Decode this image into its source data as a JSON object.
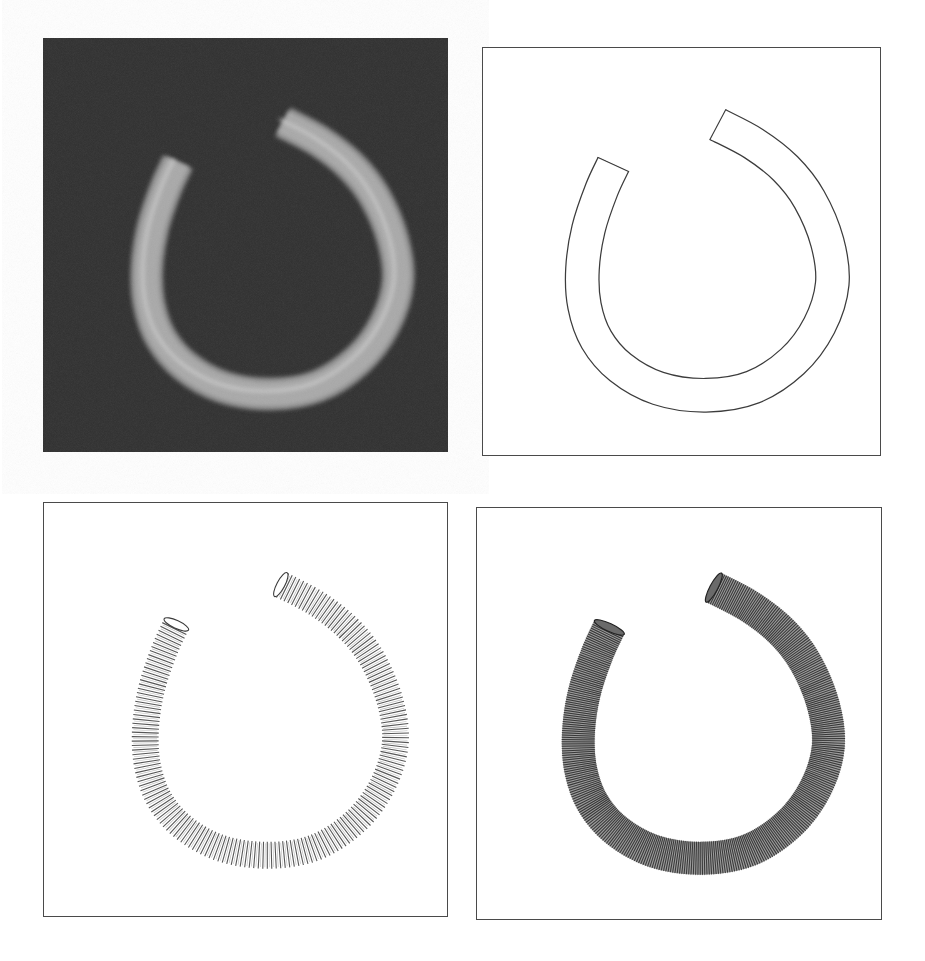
{
  "figure": {
    "centerline": [
      [
        133,
        120
      ],
      [
        121,
        146
      ],
      [
        108,
        185
      ],
      [
        102,
        225
      ],
      [
        104,
        262
      ],
      [
        116,
        296
      ],
      [
        140,
        324
      ],
      [
        178,
        345
      ],
      [
        226,
        352
      ],
      [
        273,
        344
      ],
      [
        313,
        318
      ],
      [
        340,
        282
      ],
      [
        353,
        240
      ],
      [
        348,
        198
      ],
      [
        330,
        155
      ],
      [
        306,
        124
      ],
      [
        274,
        99
      ],
      [
        238,
        80
      ]
    ],
    "panels": [
      {
        "id": "shaded",
        "label": "Shaded volume rendering on dark background",
        "box": {
          "x": 43,
          "y": 38,
          "w": 405,
          "h": 414
        },
        "style": "shaded",
        "colors": {
          "background": "#2f2f2f",
          "tube": "#a9a9a9",
          "glow": "#8c8c8c",
          "highlight": "#e6e6e6"
        },
        "tube_width": 29,
        "offset": [
          2,
          4
        ]
      },
      {
        "id": "outline",
        "label": "Silhouette outline rendering",
        "box": {
          "x": 482,
          "y": 47,
          "w": 399,
          "h": 409
        },
        "style": "outline",
        "colors": {
          "background": "#ffffff",
          "line": "#3c3c3c"
        },
        "tube_width": 33,
        "offset": [
          -2,
          -3
        ]
      },
      {
        "id": "rings",
        "label": "Sparse cross-section ring rendering",
        "box": {
          "x": 43,
          "y": 502,
          "w": 405,
          "h": 415
        },
        "style": "rings",
        "colors": {
          "background": "#ffffff",
          "line": "#3a3a3a"
        },
        "tube_width": 27,
        "ring_spacing": 4.2,
        "offset": [
          0,
          2
        ]
      },
      {
        "id": "dense",
        "label": "Dense cross-section line rendering",
        "box": {
          "x": 476,
          "y": 507,
          "w": 406,
          "h": 413
        },
        "style": "dense",
        "colors": {
          "background": "#ffffff",
          "base": "#9a9a9a",
          "line": "#3a3a3a"
        },
        "tube_width": 33,
        "ring_spacing": 2.1,
        "offset": [
          0,
          0
        ]
      }
    ]
  }
}
